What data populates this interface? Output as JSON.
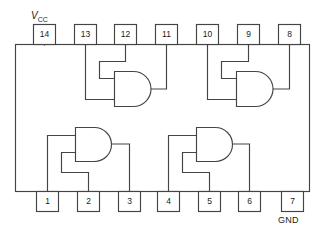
{
  "diagram": {
    "kind": "ic-pinout-diagram",
    "package": "14-pin DIP",
    "gate_type": "AND",
    "gate_count": 4,
    "body": {
      "x": 15,
      "y": 44,
      "width": 295,
      "height": 148
    },
    "colors": {
      "line": "#444444",
      "text": "#1a1a1a",
      "background": "#ffffff"
    },
    "power_labels": {
      "vcc_v": "V",
      "vcc_sub": "CC",
      "gnd": "GND"
    },
    "pins_top": [
      {
        "number": "14",
        "x": 33,
        "y": 24,
        "w": 23,
        "h": 21
      },
      {
        "number": "13",
        "x": 74,
        "y": 24,
        "w": 23,
        "h": 21
      },
      {
        "number": "12",
        "x": 114,
        "y": 24,
        "w": 23,
        "h": 21
      },
      {
        "number": "11",
        "x": 155,
        "y": 24,
        "w": 23,
        "h": 21
      },
      {
        "number": "10",
        "x": 196,
        "y": 24,
        "w": 23,
        "h": 21
      },
      {
        "number": "9",
        "x": 237,
        "y": 24,
        "w": 23,
        "h": 21
      },
      {
        "number": "8",
        "x": 278,
        "y": 24,
        "w": 23,
        "h": 21
      }
    ],
    "pins_bottom": [
      {
        "number": "1",
        "x": 36,
        "y": 192,
        "w": 23,
        "h": 21
      },
      {
        "number": "2",
        "x": 77,
        "y": 192,
        "w": 23,
        "h": 21
      },
      {
        "number": "3",
        "x": 118,
        "y": 192,
        "w": 23,
        "h": 21
      },
      {
        "number": "4",
        "x": 157,
        "y": 192,
        "w": 23,
        "h": 21
      },
      {
        "number": "5",
        "x": 198,
        "y": 192,
        "w": 23,
        "h": 21
      },
      {
        "number": "6",
        "x": 238,
        "y": 192,
        "w": 23,
        "h": 21
      },
      {
        "number": "7",
        "x": 281,
        "y": 192,
        "w": 23,
        "h": 21
      }
    ],
    "gates": [
      {
        "id": "gate-top-left",
        "inputs": [
          "13",
          "12"
        ],
        "output": "11"
      },
      {
        "id": "gate-top-right",
        "inputs": [
          "10",
          "9"
        ],
        "output": "8"
      },
      {
        "id": "gate-bottom-left",
        "inputs": [
          "1",
          "2"
        ],
        "output": "3"
      },
      {
        "id": "gate-bottom-right",
        "inputs": [
          "4",
          "5"
        ],
        "output": "6"
      }
    ]
  }
}
